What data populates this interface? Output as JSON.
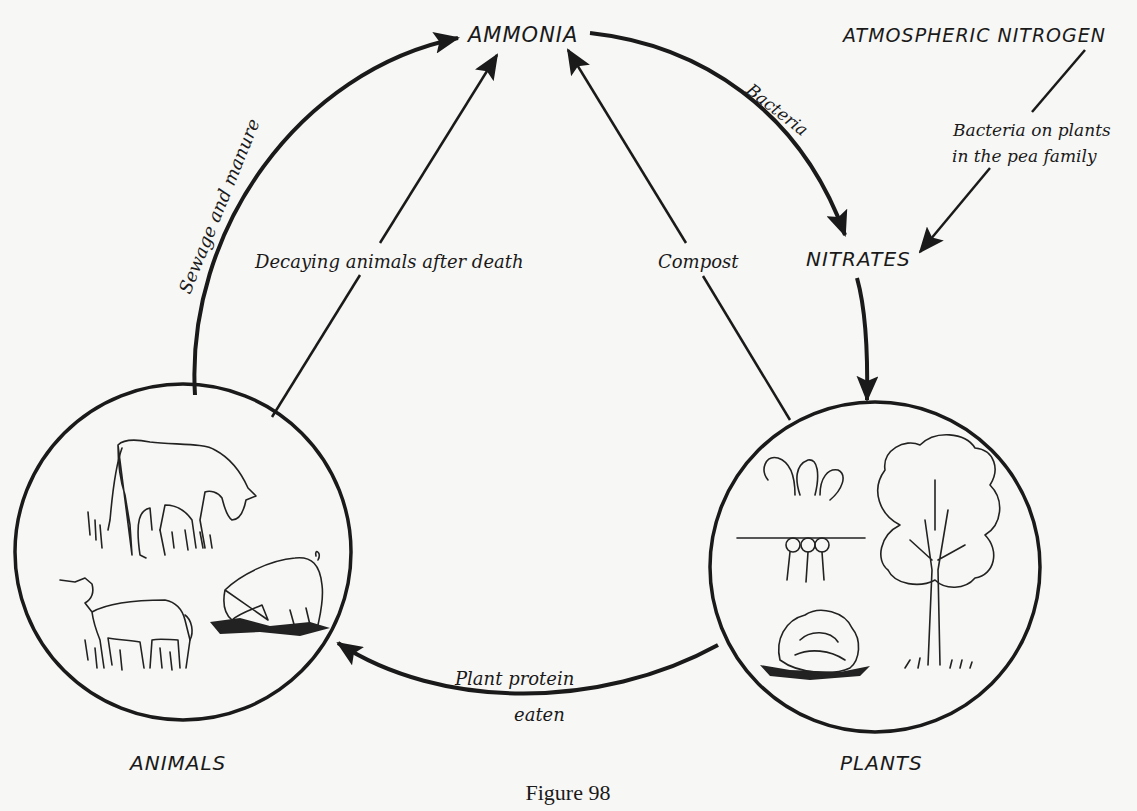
{
  "figure": {
    "caption": "Figure 98"
  },
  "nodes": {
    "ammonia": "AMMONIA",
    "atmospheric_nitrogen": "ATMOSPHERIC NITROGEN",
    "nitrates": "NITRATES",
    "animals": "ANIMALS",
    "plants": "PLANTS"
  },
  "edges": {
    "sewage": {
      "label": "Sewage and manure",
      "from": "ANIMALS",
      "to": "AMMONIA"
    },
    "decaying": {
      "label": "Decaying animals after death",
      "from": "ANIMALS",
      "to": "AMMONIA"
    },
    "compost": {
      "label": "Compost",
      "from": "PLANTS",
      "to": "AMMONIA"
    },
    "bacteria": {
      "label": "Bacteria",
      "from": "AMMONIA",
      "to": "NITRATES"
    },
    "pea_bacteria": {
      "label_line1": "Bacteria on plants",
      "label_line2": "in the pea family",
      "from": "ATMOSPHERIC NITROGEN",
      "to": "NITRATES"
    },
    "nitrates_to_plants": {
      "from": "NITRATES",
      "to": "PLANTS"
    },
    "plant_protein": {
      "label_line1": "Plant protein",
      "label_line2": "eaten",
      "from": "PLANTS",
      "to": "ANIMALS"
    }
  },
  "illustrations": {
    "animals_circle": [
      "cow",
      "goat",
      "pig"
    ],
    "plants_circle": [
      "radishes",
      "tree",
      "cabbage"
    ]
  },
  "colors": {
    "ink": "#1a1a1a",
    "paper": "#f7f7f5"
  }
}
